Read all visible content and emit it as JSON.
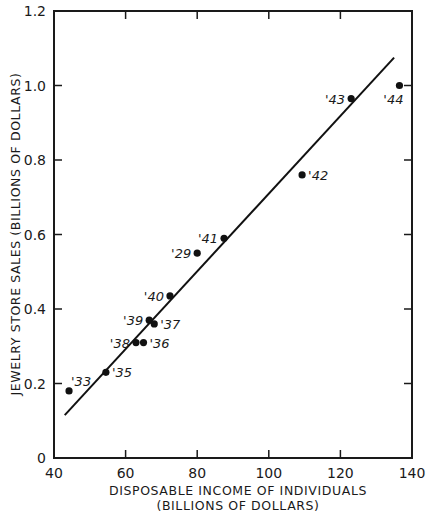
{
  "chart_data": {
    "type": "scatter",
    "title": "",
    "xlabel": "DISPOSABLE INCOME OF INDIVIDUALS",
    "xlabel_sub": "(BILLIONS OF DOLLARS)",
    "ylabel": "JEWELRY STORE SALES (BILLIONS OF DOLLARS)",
    "xlim": [
      40,
      140
    ],
    "ylim": [
      0,
      1.2
    ],
    "xticks": [
      40,
      60,
      80,
      100,
      120,
      140
    ],
    "xtick_labels": [
      "40",
      "60",
      "80",
      "100",
      "120",
      "140"
    ],
    "yticks": [
      0,
      0.2,
      0.4,
      0.6,
      0.8,
      1.0,
      1.2
    ],
    "ytick_labels": [
      "0",
      "0.2",
      "0.4",
      "0.6",
      "0.8",
      "1.0",
      "1.2"
    ],
    "grid": false,
    "legend": "none",
    "points": [
      {
        "label": "'33",
        "x": 44.2,
        "y": 0.18,
        "label_pos": "above-right"
      },
      {
        "label": "'35",
        "x": 54.5,
        "y": 0.23,
        "label_pos": "right"
      },
      {
        "label": "'38",
        "x": 62.9,
        "y": 0.31,
        "label_pos": "left"
      },
      {
        "label": "'36",
        "x": 65.0,
        "y": 0.31,
        "label_pos": "right"
      },
      {
        "label": "'39",
        "x": 66.6,
        "y": 0.37,
        "label_pos": "left"
      },
      {
        "label": "'37",
        "x": 68.0,
        "y": 0.36,
        "label_pos": "right"
      },
      {
        "label": "'40",
        "x": 72.4,
        "y": 0.435,
        "label_pos": "left"
      },
      {
        "label": "'29",
        "x": 80.0,
        "y": 0.55,
        "label_pos": "left"
      },
      {
        "label": "'41",
        "x": 87.5,
        "y": 0.59,
        "label_pos": "left"
      },
      {
        "label": "'42",
        "x": 109.3,
        "y": 0.76,
        "label_pos": "right"
      },
      {
        "label": "'43",
        "x": 123.0,
        "y": 0.965,
        "label_pos": "left"
      },
      {
        "label": "'44",
        "x": 136.5,
        "y": 1.0,
        "label_pos": "below-left"
      }
    ],
    "trend_line": {
      "x": [
        43,
        135
      ],
      "y": [
        0.115,
        1.075
      ]
    }
  }
}
